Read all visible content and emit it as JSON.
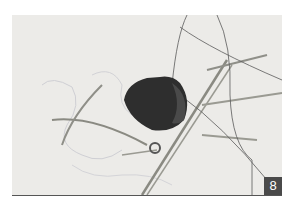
{
  "photo": {
    "subject": "embroidery-step-photo",
    "background_color": "#ecebe8",
    "object_color": "#2e2e2e"
  },
  "step_badge": {
    "label": "8",
    "color": "#4a4a4a"
  }
}
